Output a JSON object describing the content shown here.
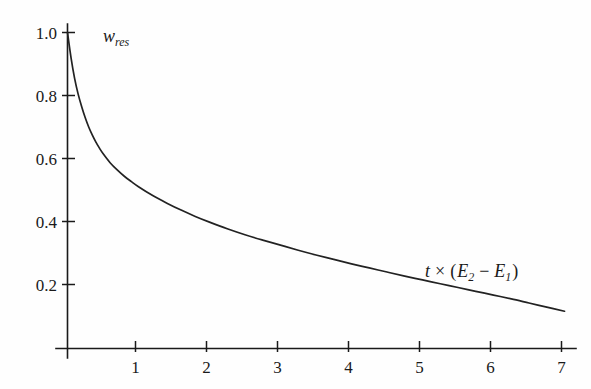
{
  "chart_data": {
    "type": "line",
    "title": "",
    "subtitle": "",
    "xlabel": "t × (E₂ − E₁)",
    "ylabel": "w_res",
    "ylabel_parts": {
      "base": "w",
      "subscript": "res"
    },
    "xlabel_parts": {
      "var": "t",
      "times": "×",
      "open": "(",
      "e2": "E",
      "e2sub": "2",
      "minus": "−",
      "e1": "E",
      "e1sub": "1",
      "close": ")"
    },
    "xlim": [
      0,
      7.2
    ],
    "ylim": [
      0,
      1.04
    ],
    "grid": false,
    "legend": false,
    "legend_position": "none",
    "xticks": [
      1,
      2,
      3,
      4,
      5,
      6,
      7
    ],
    "xticklabels": [
      "1",
      "2",
      "3",
      "4",
      "5",
      "6",
      "7"
    ],
    "yticks": [
      0.2,
      0.4,
      0.6,
      0.8,
      1.0
    ],
    "yticklabels": [
      "0.2",
      "0.4",
      "0.6",
      "0.8",
      "1.0"
    ],
    "series": [
      {
        "name": "w_res",
        "color": "#222222",
        "x": [
          0.0,
          0.05,
          0.1,
          0.15,
          0.2,
          0.25,
          0.3,
          0.35,
          0.4,
          0.45,
          0.5,
          0.6,
          0.7,
          0.8,
          0.9,
          1.0,
          1.2,
          1.4,
          1.6,
          1.8,
          2.0,
          2.25,
          2.5,
          2.75,
          3.0,
          3.25,
          3.5,
          3.75,
          4.0,
          4.25,
          4.5,
          4.75,
          5.0,
          5.25,
          5.5,
          5.75,
          6.0,
          6.25,
          6.5,
          6.75,
          7.0
        ],
        "y": [
          1.0,
          0.92,
          0.855,
          0.805,
          0.765,
          0.73,
          0.7,
          0.675,
          0.653,
          0.634,
          0.617,
          0.588,
          0.565,
          0.545,
          0.528,
          0.512,
          0.484,
          0.46,
          0.438,
          0.418,
          0.4,
          0.379,
          0.36,
          0.343,
          0.327,
          0.311,
          0.296,
          0.282,
          0.268,
          0.255,
          0.242,
          0.229,
          0.217,
          0.205,
          0.193,
          0.181,
          0.169,
          0.157,
          0.144,
          0.131,
          0.118
        ]
      }
    ],
    "colors": {
      "background": "#fefefe",
      "axis": "#1a1a1a",
      "curve": "#222222",
      "text": "#1a1a1a"
    }
  }
}
